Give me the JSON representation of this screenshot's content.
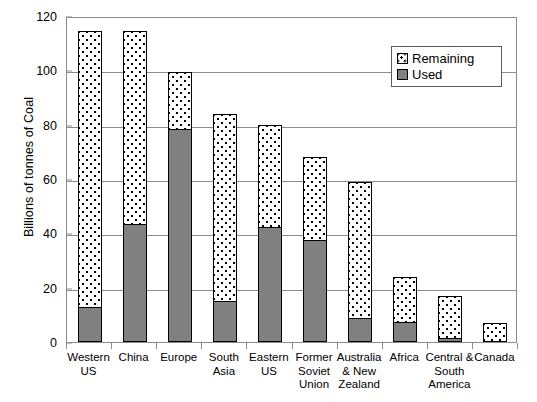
{
  "chart_data": {
    "type": "bar",
    "stacked": true,
    "title": "",
    "xlabel": "",
    "ylabel": "Billions of tonnes of Coal",
    "ylim": [
      0,
      120
    ],
    "yticks": [
      0,
      20,
      40,
      60,
      80,
      100,
      120
    ],
    "grid": true,
    "legend_position": "top-right",
    "categories": [
      "Western US",
      "China",
      "Europe",
      "South Asia",
      "Eastern US",
      "Former Soviet Union",
      "Australia & New Zealand",
      "Africa",
      "Central & South America",
      "Canada"
    ],
    "category_lines": [
      [
        "Western",
        "US"
      ],
      [
        "China"
      ],
      [
        "Europe"
      ],
      [
        "South",
        "Asia"
      ],
      [
        "Eastern",
        "US"
      ],
      [
        "Former",
        "Soviet",
        "Union"
      ],
      [
        "Australia",
        "& New",
        "Zealand"
      ],
      [
        "Africa"
      ],
      [
        "Central &",
        "South",
        "America"
      ],
      [
        "Canada"
      ]
    ],
    "series": [
      {
        "name": "Used",
        "color": "#808080",
        "values": [
          13,
          43.5,
          78.5,
          15,
          42.5,
          37.5,
          9,
          7.5,
          1.5,
          0
        ]
      },
      {
        "name": "Remaining",
        "color": "#ffffff",
        "values": [
          101.5,
          71,
          21,
          69,
          37.5,
          30.5,
          50,
          16.5,
          15.5,
          7
        ]
      }
    ],
    "totals": [
      114.5,
      114.5,
      99.5,
      84,
      80,
      68,
      59,
      24,
      17,
      7
    ]
  },
  "legend": {
    "items": [
      {
        "label": "Remaining",
        "swatch": "pattern-dotted"
      },
      {
        "label": "Used",
        "swatch": "solid-gray"
      }
    ]
  },
  "axis": {
    "y_title": "Billions of tonnes of Coal",
    "y_tick_labels": [
      "120",
      "100",
      "80",
      "60",
      "40",
      "20",
      "0"
    ]
  }
}
